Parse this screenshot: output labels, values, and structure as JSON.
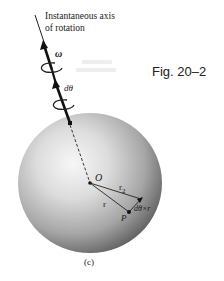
{
  "figure": {
    "label": "Fig. 20–2",
    "subfigure": "(c)",
    "axis_caption": {
      "line1": "Instantaneous axis",
      "line2": "of rotation"
    },
    "symbols": {
      "omega": "ω",
      "dtheta": "dθ",
      "origin": "O",
      "r2": "r",
      "r2_sub": "2",
      "r": "r",
      "point": "P",
      "displacement": "dθ×r"
    },
    "colors": {
      "ink": "#111111",
      "sphere_light": "#f4f4f4",
      "sphere_dark": "#5a5a5a",
      "background": "#ffffff"
    }
  }
}
